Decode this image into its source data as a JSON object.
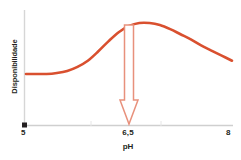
{
  "chart_data": {
    "type": "line",
    "title": "",
    "subtitle": "",
    "xlabel": "pH",
    "ylabel": "Disponibilidade",
    "xlim": [
      5,
      8
    ],
    "ylim": [
      0,
      1
    ],
    "grid": false,
    "legend": null,
    "x_tick_labels": [
      "5",
      "6,5",
      "8"
    ],
    "x_tick_values": [
      5,
      6.5,
      8
    ],
    "y_tick_labels": [],
    "series": [
      {
        "name": "Disponibilidade",
        "color": "#d9502f",
        "x": [
          5.0,
          5.15,
          5.3,
          5.45,
          5.6,
          5.75,
          5.9,
          6.05,
          6.2,
          6.35,
          6.5,
          6.65,
          6.8,
          6.95,
          7.1,
          7.25,
          7.4,
          7.55,
          7.7,
          7.85,
          8.0
        ],
        "y": [
          0.5,
          0.5,
          0.5,
          0.51,
          0.53,
          0.57,
          0.63,
          0.72,
          0.82,
          0.91,
          0.97,
          1.0,
          1.0,
          0.98,
          0.94,
          0.89,
          0.84,
          0.78,
          0.73,
          0.68,
          0.63
        ]
      }
    ],
    "annotations": [
      {
        "kind": "arrow",
        "name": "optimum-ph-arrow",
        "color": "#e8917c",
        "x": 6.5,
        "y_from": 1.0,
        "y_to": 0.0,
        "direction": "down",
        "label": ""
      },
      {
        "kind": "marker",
        "name": "origin-marker",
        "color": "#231f20",
        "x": 5,
        "y": 0,
        "shape": "square"
      }
    ]
  },
  "axis": {
    "x_title": "pH",
    "y_title": "Disponibilidade",
    "ticks": {
      "left": "5",
      "middle": "6,5",
      "right": "8"
    }
  },
  "colors": {
    "curve": "#d9502f",
    "arrow": "#e8917c",
    "axis": "#d6d6d6",
    "text": "#231f20",
    "background": "#ffffff"
  }
}
